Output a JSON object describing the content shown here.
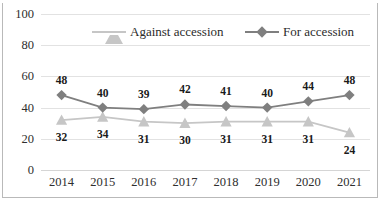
{
  "chart_data": {
    "type": "line",
    "title": "",
    "xlabel": "",
    "ylabel": "",
    "categories": [
      "2014",
      "2015",
      "2016",
      "2017",
      "2018",
      "2019",
      "2020",
      "2021"
    ],
    "ylim": [
      0,
      100
    ],
    "yticks": [
      0,
      20,
      40,
      60,
      80,
      100
    ],
    "grid": true,
    "legend_position": "top-inside",
    "series": [
      {
        "name": "Against accession",
        "color": "#c6c6c6",
        "marker": "triangle",
        "values": [
          32,
          34,
          31,
          30,
          31,
          31,
          31,
          24
        ],
        "label_offsets": [
          -1,
          -1,
          -1,
          -1,
          -1,
          -1,
          -1,
          -2
        ]
      },
      {
        "name": "For accession",
        "color": "#7f7f7f",
        "marker": "diamond",
        "values": [
          48,
          40,
          39,
          42,
          41,
          40,
          44,
          48
        ],
        "label_offsets": [
          1,
          1,
          1,
          1,
          1,
          1,
          1,
          1
        ]
      }
    ]
  },
  "axes": {
    "y_tick_labels": [
      "100",
      "80",
      "60",
      "40",
      "20",
      "0"
    ],
    "x_tick_labels": [
      "2014",
      "2015",
      "2016",
      "2017",
      "2018",
      "2019",
      "2020",
      "2021"
    ]
  },
  "legend": {
    "items": [
      {
        "label": "Against accession"
      },
      {
        "label": "For accession"
      }
    ]
  },
  "colors": {
    "series_against": "#c6c6c6",
    "series_for": "#7f7f7f",
    "gridline": "#e2e2e2",
    "frame": "#b9b9b9",
    "text": "#2e2e2e",
    "data_label": "#1a1a1a"
  }
}
